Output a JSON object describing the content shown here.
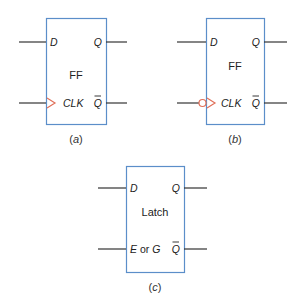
{
  "colors": {
    "box_border": "#5b8ec9",
    "wire": "#333333",
    "clock_symbol": "#e0705a",
    "text": "#222222"
  },
  "diagrams": [
    {
      "id": "a",
      "caption_letter": "a",
      "block_label": "FF",
      "pins": {
        "d": "D",
        "q": "Q",
        "clk": "CLK",
        "qbar": "Q"
      },
      "clock_type": "rising-edge"
    },
    {
      "id": "b",
      "caption_letter": "b",
      "block_label": "FF",
      "pins": {
        "d": "D",
        "q": "Q",
        "clk": "CLK",
        "qbar": "Q"
      },
      "clock_type": "falling-edge"
    },
    {
      "id": "c",
      "caption_letter": "c",
      "block_label": "Latch",
      "pins": {
        "d": "D",
        "q": "Q",
        "enable_prefix": "E",
        "enable_or": " or ",
        "enable_suffix": "G",
        "qbar": "Q"
      },
      "clock_type": "level"
    }
  ],
  "caption_paren_open": "(",
  "caption_paren_close": ")"
}
